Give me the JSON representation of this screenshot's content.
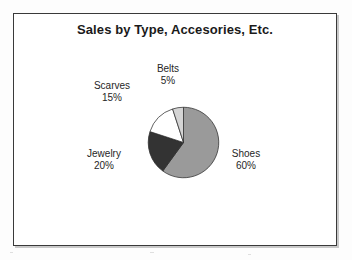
{
  "page": {
    "background_color": "#fdfdfd",
    "frame_border_color": "#3a3a3a"
  },
  "chart": {
    "title": "Sales by Type, Accesories, Etc."
  },
  "chart_data": {
    "type": "pie",
    "title": "Sales by Type, Accesories, Etc.",
    "xlabel": "",
    "ylabel": "",
    "grid": false,
    "legend_position": "none",
    "labels_position": "outside-callout",
    "start_angle_deg": 0,
    "direction": "clockwise",
    "categories": [
      "Shoes",
      "Jewelry",
      "Scarves",
      "Belts"
    ],
    "values": [
      60,
      20,
      15,
      5
    ],
    "value_unit": "%",
    "slices": [
      {
        "name": "Shoes",
        "value": 60,
        "label": "Shoes",
        "percent_label": "60%",
        "color": "#9a9a9a",
        "start_deg": 0,
        "end_deg": 216
      },
      {
        "name": "Jewelry",
        "value": 20,
        "label": "Jewelry",
        "percent_label": "20%",
        "color": "#333333",
        "start_deg": 216,
        "end_deg": 288
      },
      {
        "name": "Scarves",
        "value": 15,
        "label": "Scarves",
        "percent_label": "15%",
        "color": "#ffffff",
        "start_deg": 288,
        "end_deg": 342
      },
      {
        "name": "Belts",
        "value": 5,
        "label": "Belts",
        "percent_label": "5%",
        "color": "#d4d4d4",
        "start_deg": 342,
        "end_deg": 360
      }
    ]
  }
}
